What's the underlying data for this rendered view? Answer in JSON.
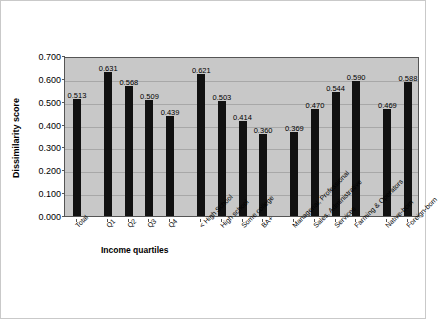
{
  "chart_data": {
    "type": "bar",
    "title": "",
    "xlabel": "Income quartiles",
    "ylabel": "Dissimilarity score",
    "ylim": [
      0.0,
      0.7
    ],
    "ytick_labels": [
      "0.000",
      "0.100",
      "0.200",
      "0.300",
      "0.400",
      "0.500",
      "0.600",
      "0.700"
    ],
    "ytick_values": [
      0.0,
      0.1,
      0.2,
      0.3,
      0.4,
      0.5,
      0.6,
      0.7
    ],
    "grid": true,
    "legend": "none",
    "bar_color": "#111111",
    "plot_background": "#c8c8c8",
    "categories": [
      "Total",
      "Q1",
      "Q2",
      "Q3",
      "Q4",
      "< High School",
      "High school",
      "Some college",
      "BA+",
      "Managerial, Professional",
      "Sales, Administrative",
      "Services",
      "Farming & Operators",
      "Native-born",
      "Foreign-born"
    ],
    "values": [
      0.513,
      0.631,
      0.568,
      0.509,
      0.439,
      0.621,
      0.503,
      0.414,
      0.36,
      0.369,
      0.47,
      0.544,
      0.59,
      0.469,
      0.588
    ],
    "value_labels": [
      "0.513",
      "0.631",
      "0.568",
      "0.509",
      "0.439",
      "0.621",
      "0.503",
      "0.414",
      "0.360",
      "0.369",
      "0.470",
      "0.544",
      "0.590",
      "0.469",
      "0.588"
    ],
    "groups": [
      {
        "name": "Total",
        "indices": [
          0
        ]
      },
      {
        "name": "Income quartiles",
        "indices": [
          1,
          2,
          3,
          4
        ]
      },
      {
        "name": "Education",
        "indices": [
          5,
          6,
          7,
          8
        ]
      },
      {
        "name": "Occupation",
        "indices": [
          9,
          10,
          11,
          12
        ]
      },
      {
        "name": "Nativity",
        "indices": [
          13,
          14
        ]
      }
    ]
  }
}
